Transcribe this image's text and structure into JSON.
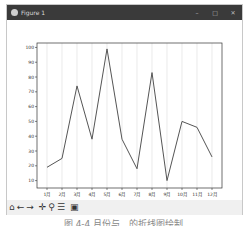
{
  "window": {
    "title": "Figure 1",
    "controls": {
      "minimize": "–",
      "maximize": "□",
      "close": "✕"
    }
  },
  "toolbar": {
    "items": [
      {
        "name": "home",
        "glyph": "⌂"
      },
      {
        "name": "back",
        "glyph": "←"
      },
      {
        "name": "forward",
        "glyph": "→"
      },
      {
        "name": "pan",
        "glyph": "✛"
      },
      {
        "name": "zoom",
        "glyph": "⚲"
      },
      {
        "name": "configure-subplots",
        "glyph": "☰"
      },
      {
        "name": "save",
        "glyph": "▣"
      }
    ]
  },
  "caption": "图 4-4  月份与…的折线图绘制",
  "chart_data": {
    "type": "line",
    "categories": [
      "1月",
      "2月",
      "3月",
      "4月",
      "5月",
      "6月",
      "7月",
      "8月",
      "9月",
      "10月",
      "11月",
      "12月"
    ],
    "values": [
      19,
      25,
      74,
      38,
      99,
      38,
      18,
      83,
      10,
      50,
      46,
      26
    ],
    "title": "",
    "xlabel": "",
    "ylabel": "",
    "yticks": [
      10,
      20,
      30,
      40,
      50,
      60,
      70,
      80,
      90,
      100
    ],
    "ylim": [
      5,
      103
    ],
    "grid": "vertical",
    "line_color": "#555555"
  }
}
